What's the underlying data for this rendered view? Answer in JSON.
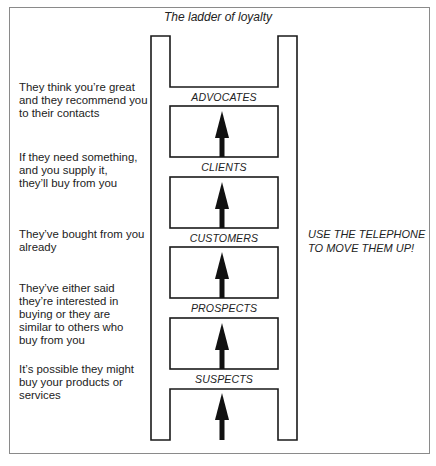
{
  "title": "The ladder of loyalty",
  "rungs": [
    {
      "label": "ADVOCATES",
      "description": "They think you're great and they recommend you to their contacts",
      "lines": [
        "They think you’re great",
        "and they recommend you",
        "to their contacts"
      ]
    },
    {
      "label": "CLIENTS",
      "description": "If they need something, and you supply it, they'll buy from you",
      "lines": [
        "If they need something,",
        "and you supply it,",
        "they’ll buy from you"
      ]
    },
    {
      "label": "CUSTOMERS",
      "description": "They've bought from you already",
      "lines": [
        "They’ve bought from you",
        "already"
      ]
    },
    {
      "label": "PROSPECTS",
      "description": "They've either said they're interested in buying or they are similar to others who buy from you",
      "lines": [
        "They’ve either said",
        "they’re interested in",
        "buying or they are",
        "similar to others who",
        "buy from you"
      ]
    },
    {
      "label": "SUSPECTS",
      "description": "It's possible they might buy your products or services",
      "lines": [
        "It’s possible they might",
        "buy your products or",
        "services"
      ]
    }
  ],
  "callout": {
    "line1": "USE THE TELEPHONE",
    "line2": "TO MOVE THEM UP!"
  },
  "colors": {
    "ink": "#1a1a1a",
    "frame": "#8a8a8a",
    "background": "#ffffff"
  }
}
